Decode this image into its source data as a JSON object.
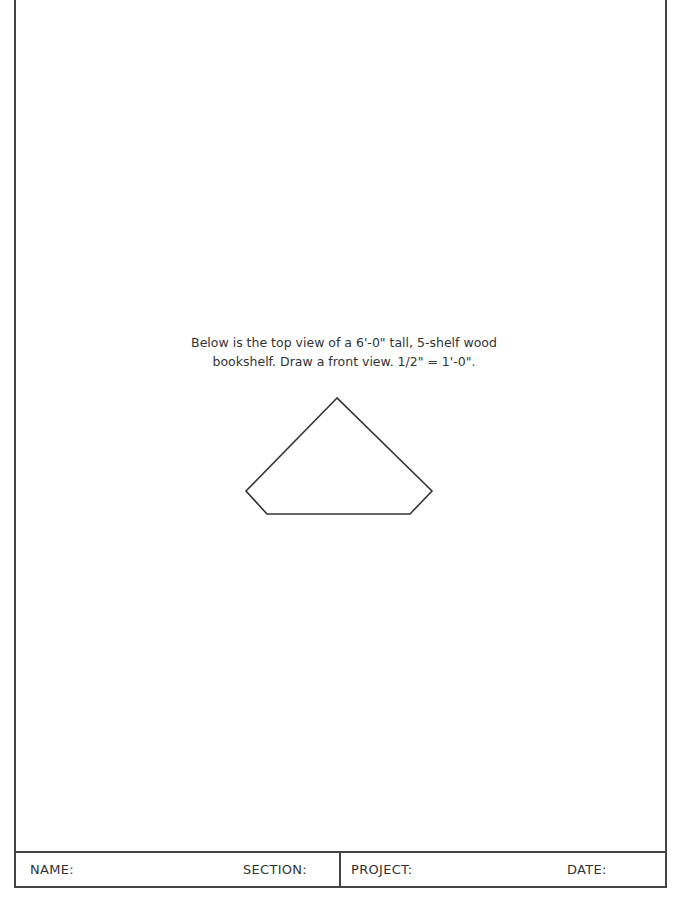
{
  "worksheet": {
    "instructions": {
      "line1": "Below is the top view of a 6'-0\" tall, 5-shelf wood",
      "line2": "bookshelf. Draw a front view. 1/2\" = 1'-0\"."
    },
    "top_view_shape": {
      "description": "top view outline of corner bookshelf (pentagon)",
      "points": "337,398 246,491 267,514 410,514 432,491",
      "stroke": "#333333"
    },
    "title_block": {
      "name_label": "NAME:",
      "section_label": "SECTION:",
      "project_label": "PROJECT:",
      "date_label": "DATE:"
    }
  }
}
